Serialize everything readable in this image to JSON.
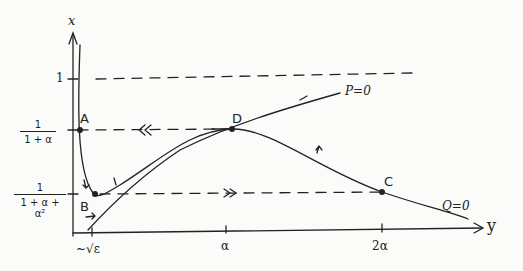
{
  "diagram": {
    "axes": {
      "x_label": "x",
      "y_label": "y"
    },
    "y_ticks": [
      {
        "label": "1"
      },
      {
        "num": "1",
        "den": "1 + α"
      },
      {
        "num": "1",
        "den": "1 + α + α²"
      }
    ],
    "x_ticks": [
      "~√ε",
      "α",
      "2α"
    ],
    "points": [
      "A",
      "B",
      "C",
      "D"
    ],
    "curves": [
      "P=0",
      "Q=0"
    ],
    "flow_markers": {
      "fast_left": "≪",
      "fast_right": "≫"
    },
    "colors": {
      "ink": "#222222",
      "paper": "#fbfbf9"
    }
  }
}
